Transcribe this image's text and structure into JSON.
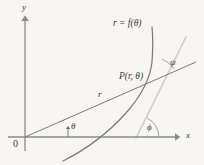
{
  "figure": {
    "kind": "polar-coordinate-tangent-angle-diagram",
    "background_color": "#f8f6f3",
    "axis_color": "#8a8a8a",
    "curve_color": "#7d7a76",
    "ray_color": "#6f6c68",
    "tangent_color": "#cfccc6",
    "text_color": "#3a3a3a",
    "width": 204,
    "height": 165
  },
  "axes": {
    "y_label": "y",
    "x_label": "x",
    "origin_label": "0"
  },
  "labels": {
    "curve_equation": "r = f(θ)",
    "point": "P(r, θ)",
    "radius": "r",
    "angle_theta": "θ",
    "angle_phi": "ϕ",
    "angle_psi": "ψ"
  },
  "geometry": {
    "origin": {
      "x": 25,
      "y": 137
    },
    "y_axis": {
      "x1": 25,
      "y1": 150,
      "x2": 25,
      "y2": 18
    },
    "x_axis": {
      "x1": 8,
      "y1": 137,
      "x2": 178,
      "y2": 137
    },
    "point_P": {
      "x": 150,
      "y": 80
    },
    "radial_ray": {
      "x1": 25,
      "y1": 137,
      "x2": 196,
      "y2": 62
    },
    "tangent_line": {
      "x1": 136,
      "y1": 138,
      "x2": 186,
      "y2": 37
    },
    "curve_path": "M 63 161 C 85 150 108 133 126 113 C 141 96 150 80 152 62 C 153 48 153 36 152 27",
    "theta_arc": {
      "cx": 25,
      "cy": 137,
      "r": 47,
      "start_deg": 0,
      "end_deg": 23.7
    },
    "phi_arc": {
      "cx": 136,
      "cy": 138,
      "r": 24,
      "start_deg": 0,
      "end_deg": 63.7
    },
    "psi_arc": {
      "cx": 150,
      "cy": 80,
      "r": 26,
      "start_deg": -23.7,
      "end_deg": -63.7
    }
  },
  "label_positions": {
    "y_label": {
      "left": 22,
      "top": 4
    },
    "x_label": {
      "left": 186,
      "top": 132
    },
    "origin_label": {
      "left": 13,
      "top": 139
    },
    "curve_equation": {
      "left": 113,
      "top": 19
    },
    "point": {
      "left": 120,
      "top": 73
    },
    "radius": {
      "left": 98,
      "top": 91
    },
    "angle_theta": {
      "left": 70,
      "top": 123
    },
    "angle_phi": {
      "left": 147,
      "top": 124
    },
    "angle_psi": {
      "left": 170,
      "top": 59
    }
  }
}
